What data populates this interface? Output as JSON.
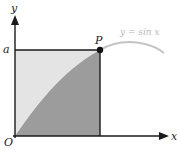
{
  "diagram": {
    "labels": {
      "y_axis": "y",
      "x_axis": "x",
      "origin": "O",
      "a_tick": "a",
      "point": "P",
      "curve": "y = sin x"
    },
    "colors": {
      "light_region": "#e4e4e4",
      "dark_region": "#9c9c9c",
      "curve_outside": "#c4c4c4",
      "axes": "#1a1a1a"
    }
  }
}
